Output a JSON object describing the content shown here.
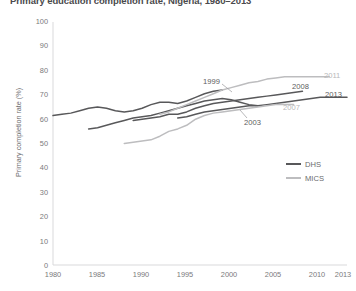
{
  "title": "Primary education completion rate, Nigeria, 1980–2013",
  "axes": {
    "ylabel": "Primary completion rate (%)",
    "xlabel": "",
    "yticks": [
      "100",
      "90",
      "80",
      "70",
      "60",
      "50",
      "40",
      "30",
      "20",
      "10",
      "0"
    ],
    "xticks": [
      "1980",
      "1985",
      "1990",
      "1995",
      "2000",
      "2005",
      "2010",
      "2013"
    ]
  },
  "legend": {
    "items": [
      {
        "label": "DHS",
        "color": "#58585a"
      },
      {
        "label": "MICS",
        "color": "#bdbdbf"
      }
    ]
  },
  "annotations": [
    {
      "text": "1999",
      "series": "DHS"
    },
    {
      "text": "2003",
      "series": "DHS"
    },
    {
      "text": "2008",
      "series": "DHS"
    },
    {
      "text": "2013",
      "series": "DHS"
    },
    {
      "text": "2007",
      "series": "MICS"
    },
    {
      "text": "2011",
      "series": "MICS"
    }
  ],
  "chart_data": {
    "type": "line",
    "title": "Primary education completion rate, Nigeria, 1980–2013",
    "xlabel": "",
    "ylabel": "Primary completion rate (%)",
    "xlim": [
      1980,
      2013
    ],
    "ylim": [
      0,
      100
    ],
    "ytick_step": 10,
    "grid": false,
    "legend_position": "center-right",
    "colors": {
      "DHS": "#58585a",
      "MICS": "#bdbdbf"
    },
    "series": [
      {
        "name": "1999",
        "group": "DHS",
        "color": "#58585a",
        "x": [
          1980,
          1981,
          1982,
          1983,
          1984,
          1985,
          1986,
          1987,
          1988,
          1989,
          1990,
          1991,
          1992,
          1993,
          1994,
          1995,
          1996,
          1997,
          1998,
          1999
        ],
        "y": [
          61.5,
          62.0,
          62.5,
          63.5,
          64.5,
          65.0,
          64.5,
          63.5,
          63.0,
          63.5,
          64.5,
          66.0,
          67.0,
          67.0,
          66.5,
          67.5,
          69.0,
          70.5,
          71.5,
          72.0
        ]
      },
      {
        "name": "2003",
        "group": "DHS",
        "color": "#58585a",
        "x": [
          1984,
          1985,
          1986,
          1987,
          1988,
          1989,
          1990,
          1991,
          1992,
          1993,
          1994,
          1995,
          1996,
          1997,
          1998,
          1999,
          2000,
          2001,
          2002,
          2003
        ],
        "y": [
          56.0,
          56.5,
          57.5,
          58.5,
          59.5,
          60.5,
          61.0,
          61.5,
          62.5,
          63.5,
          64.5,
          65.5,
          66.5,
          67.5,
          68.0,
          68.5,
          68.0,
          67.0,
          66.0,
          65.5
        ]
      },
      {
        "name": "2008",
        "group": "DHS",
        "color": "#58585a",
        "x": [
          1989,
          1990,
          1991,
          1992,
          1993,
          1994,
          1995,
          1996,
          1997,
          1998,
          1999,
          2000,
          2001,
          2002,
          2003,
          2004,
          2005,
          2006,
          2007,
          2008
        ],
        "y": [
          59.5,
          60.0,
          60.5,
          61.0,
          62.0,
          62.0,
          63.0,
          64.5,
          65.5,
          66.5,
          67.0,
          67.5,
          68.0,
          68.5,
          69.0,
          69.5,
          70.0,
          70.5,
          71.0,
          71.5
        ]
      },
      {
        "name": "2013",
        "group": "DHS",
        "color": "#58585a",
        "x": [
          1994,
          1995,
          1996,
          1997,
          1998,
          1999,
          2000,
          2001,
          2002,
          2003,
          2004,
          2005,
          2006,
          2007,
          2008,
          2009,
          2010,
          2011,
          2012,
          2013
        ],
        "y": [
          60.5,
          61.0,
          62.0,
          63.0,
          63.5,
          64.0,
          64.5,
          65.0,
          65.5,
          65.5,
          66.0,
          66.5,
          67.0,
          67.5,
          68.0,
          68.5,
          69.0,
          69.0,
          69.0,
          69.0
        ]
      },
      {
        "name": "2007",
        "group": "MICS",
        "color": "#bdbdbf",
        "x": [
          1988,
          1989,
          1990,
          1991,
          1992,
          1993,
          1994,
          1995,
          1996,
          1997,
          1998,
          1999,
          2000,
          2001,
          2002,
          2003,
          2004,
          2005,
          2006,
          2007
        ],
        "y": [
          50.0,
          50.5,
          51.0,
          51.5,
          53.0,
          55.0,
          56.0,
          57.5,
          60.0,
          61.5,
          62.5,
          63.0,
          63.5,
          64.0,
          64.5,
          65.0,
          65.5,
          66.0,
          66.0,
          66.0
        ]
      },
      {
        "name": "2011",
        "group": "MICS",
        "color": "#bdbdbf",
        "x": [
          1992,
          1993,
          1994,
          1995,
          1996,
          1997,
          1998,
          1999,
          2000,
          2001,
          2002,
          2003,
          2004,
          2005,
          2006,
          2007,
          2008,
          2009,
          2010,
          2011
        ],
        "y": [
          62.0,
          63.0,
          64.5,
          66.0,
          67.5,
          69.0,
          70.5,
          72.0,
          73.0,
          74.0,
          75.0,
          75.5,
          76.5,
          77.0,
          77.5,
          77.5,
          77.5,
          77.5,
          77.5,
          77.5
        ]
      }
    ]
  }
}
